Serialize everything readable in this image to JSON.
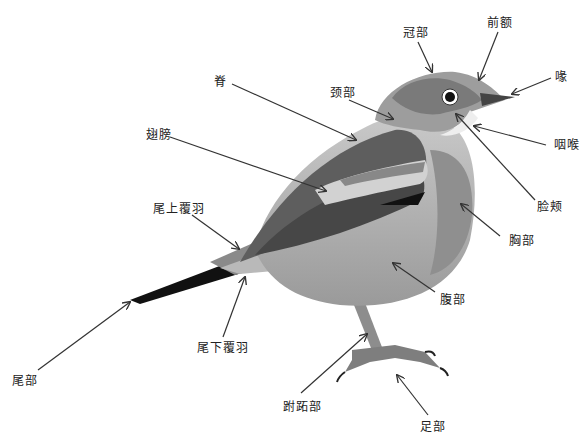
{
  "labels": {
    "crown": {
      "text": "冠部",
      "x": 403,
      "y": 26
    },
    "forehead": {
      "text": "前额",
      "x": 487,
      "y": 16
    },
    "bill": {
      "text": "喙",
      "x": 557,
      "y": 71
    },
    "back": {
      "text": "脊",
      "x": 214,
      "y": 72
    },
    "nape": {
      "text": "颈部",
      "x": 330,
      "y": 84
    },
    "throat": {
      "text": "咽喉",
      "x": 554,
      "y": 136
    },
    "wing": {
      "text": "翅膀",
      "x": 146,
      "y": 128
    },
    "cheek": {
      "text": "脸颊",
      "x": 537,
      "y": 199
    },
    "uppertail_coverts": {
      "text": "尾上覆羽",
      "x": 153,
      "y": 201
    },
    "breast": {
      "text": "胸部",
      "x": 509,
      "y": 233
    },
    "belly": {
      "text": "腹部",
      "x": 440,
      "y": 292
    },
    "undertail_coverts": {
      "text": "尾下覆羽",
      "x": 197,
      "y": 341
    },
    "tail": {
      "text": "尾部",
      "x": 12,
      "y": 373
    },
    "tarsus": {
      "text": "跗跖部",
      "x": 283,
      "y": 400
    },
    "foot": {
      "text": "足部",
      "x": 420,
      "y": 420
    }
  },
  "colors": {
    "background": "#ffffff",
    "line": "#333333",
    "dark": "#3a3a3a",
    "mid": "#7a7a7a",
    "light": "#bdbdbd",
    "pale": "#e2e2e2"
  }
}
